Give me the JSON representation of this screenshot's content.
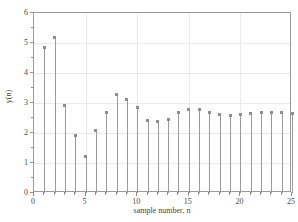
{
  "chart_data": {
    "type": "scatter",
    "plot_style": "stem",
    "title": "",
    "xlabel": "sample number, n",
    "ylabel": "y(n)",
    "xlim": [
      0,
      25
    ],
    "ylim": [
      0,
      6
    ],
    "xticks": [
      0,
      5,
      10,
      15,
      20,
      25
    ],
    "xticklabels": [
      "0",
      "5",
      "10",
      "15",
      "20",
      "25"
    ],
    "yticks": [
      0,
      1,
      2,
      3,
      4,
      5,
      6
    ],
    "yticklabels": [
      "0",
      "1",
      "2",
      "3",
      "4",
      "5",
      "6"
    ],
    "x_minor_tick_step": 1,
    "grid": true,
    "legend": null,
    "x": [
      1,
      2,
      3,
      4,
      5,
      6,
      7,
      8,
      9,
      10,
      11,
      12,
      13,
      14,
      15,
      16,
      17,
      18,
      19,
      20,
      21,
      22,
      23,
      24,
      25
    ],
    "values": [
      4.85,
      5.2,
      2.91,
      1.93,
      1.23,
      2.08,
      2.7,
      3.3,
      3.12,
      2.84,
      2.42,
      2.4,
      2.46,
      2.7,
      2.78,
      2.78,
      2.68,
      2.62,
      2.6,
      2.63,
      2.66,
      2.69,
      2.69,
      2.68,
      2.66
    ],
    "marker": "square",
    "marker_color": "#8e8e8e",
    "stem_color": "#9b9b9b",
    "axes_color": "#9a9a9a",
    "grid_color": "#e9e9e9",
    "background_color": "#ffffff"
  }
}
